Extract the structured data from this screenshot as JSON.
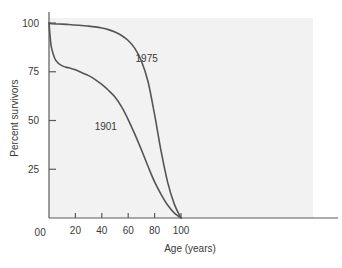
{
  "chart_data": {
    "type": "line",
    "title": "",
    "xlabel": "Age (years)",
    "ylabel": "Percent survivors",
    "xlim": [
      0,
      108
    ],
    "ylim": [
      0,
      103
    ],
    "grid": false,
    "legend_position": "inline-annotation",
    "xticks": [
      0,
      20,
      40,
      60,
      80,
      100
    ],
    "xtick_labels": [
      "0",
      "20",
      "40",
      "60",
      "80",
      "100"
    ],
    "yticks": [
      0,
      25,
      50,
      75,
      100
    ],
    "ytick_labels": [
      "0",
      "25",
      "50",
      "75",
      "100"
    ],
    "x": [
      0,
      1,
      2,
      5,
      10,
      15,
      20,
      25,
      30,
      35,
      40,
      45,
      50,
      55,
      60,
      65,
      70,
      75,
      80,
      85,
      90,
      95,
      100
    ],
    "series": [
      {
        "name": "1975",
        "label": "1975",
        "color": "#555555",
        "label_x": 74,
        "label_y": 80,
        "values": [
          100,
          99.7,
          99.6,
          99.5,
          99.4,
          99.2,
          99.0,
          98.7,
          98.4,
          98.0,
          97.4,
          96.6,
          95.4,
          93.6,
          91.0,
          87.0,
          80.5,
          70.0,
          53.0,
          34.0,
          18.0,
          7.0,
          0
        ]
      },
      {
        "name": "1901",
        "label": "1901",
        "color": "#555555",
        "label_x": 43,
        "label_y": 45,
        "values": [
          100,
          92.0,
          87.0,
          81.0,
          78.0,
          77.0,
          76.0,
          74.5,
          73.0,
          71.0,
          68.5,
          65.5,
          62.0,
          57.0,
          50.5,
          43.0,
          35.0,
          26.5,
          18.5,
          12.0,
          6.5,
          2.5,
          0
        ]
      }
    ],
    "annotations": [
      {
        "text": "1975",
        "x": 74,
        "y": 80
      },
      {
        "text": "1901",
        "x": 43,
        "y": 45
      }
    ],
    "colors": {
      "plot_background": "#f2f2f2",
      "page_background": "#ffffff",
      "axis": "#5a5a5a",
      "text": "#3a3a3a",
      "curve": "#555555"
    }
  }
}
